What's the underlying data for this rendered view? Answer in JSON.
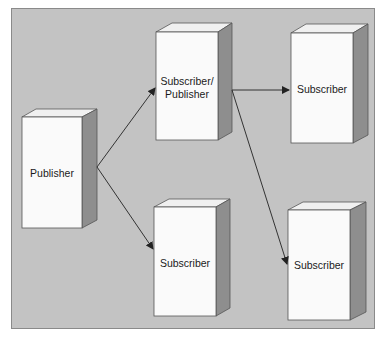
{
  "diagram": {
    "type": "publish-subscribe",
    "colors": {
      "background": "#c3c3c3",
      "box_front": "#fafafa",
      "box_top": "#f0f0f0",
      "box_side": "#8e8e8e",
      "arrow": "#333333"
    },
    "nodes": [
      {
        "id": "publisher",
        "label_lines": [
          "Publisher"
        ]
      },
      {
        "id": "subscriber-publisher",
        "label_lines": [
          "Subscriber/",
          "Publisher"
        ]
      },
      {
        "id": "subscriber-top-right",
        "label_lines": [
          "Subscriber"
        ]
      },
      {
        "id": "subscriber-bottom-middle",
        "label_lines": [
          "Subscriber"
        ]
      },
      {
        "id": "subscriber-bottom-right",
        "label_lines": [
          "Subscriber"
        ]
      }
    ],
    "edges": [
      {
        "from": "publisher",
        "to": "subscriber-publisher"
      },
      {
        "from": "publisher",
        "to": "subscriber-bottom-middle"
      },
      {
        "from": "subscriber-publisher",
        "to": "subscriber-top-right"
      },
      {
        "from": "subscriber-publisher",
        "to": "subscriber-bottom-right"
      }
    ]
  }
}
